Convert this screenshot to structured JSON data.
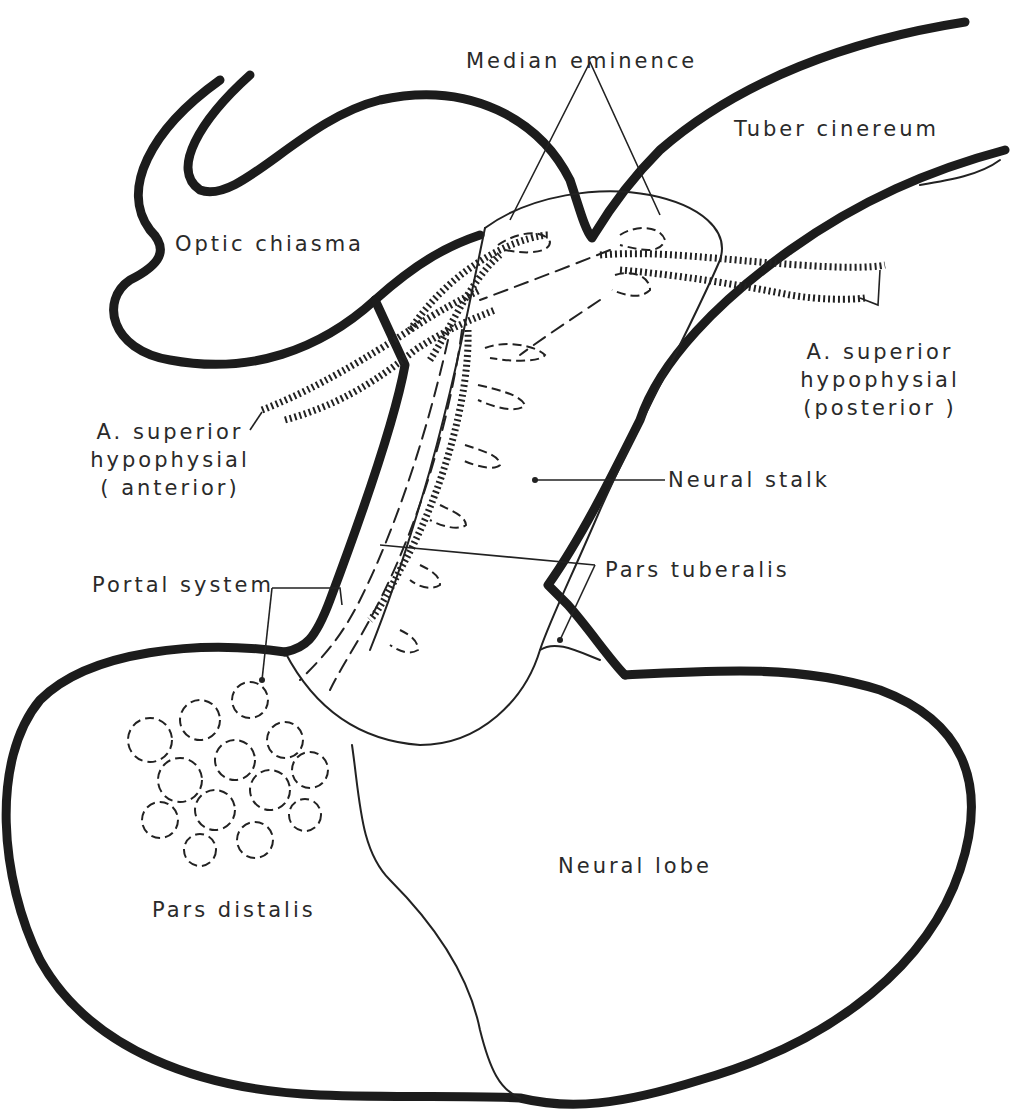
{
  "figure": {
    "labels": {
      "median_eminence": "Median eminence",
      "tuber_cinereum": "Tuber cinereum",
      "optic_chiasma": "Optic chiasma",
      "sup_hyp_posterior": [
        "A. superior",
        "hypophysial",
        "(posterior )"
      ],
      "sup_hyp_anterior": [
        "A. superior",
        "hypophysial",
        "( anterior)"
      ],
      "neural_stalk": "Neural stalk",
      "portal_system": "Portal system",
      "pars_tuberalis": "Pars tuberalis",
      "neural_lobe": "Neural lobe",
      "pars_distalis": "Pars distalis"
    },
    "colors": {
      "ink": "#1c1c1c",
      "background": "#ffffff"
    }
  }
}
